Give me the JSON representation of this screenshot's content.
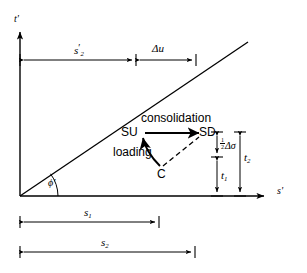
{
  "figure": {
    "type": "stress-path-diagram"
  },
  "axes": {
    "y_label": "t'",
    "x_label": "s'",
    "origin_x": 20,
    "origin_y": 196
  },
  "failure_line": {
    "label": "Kf-line",
    "angle_label": "ϕ'",
    "start": [
      20,
      196
    ],
    "end": [
      248,
      42
    ]
  },
  "points": {
    "su": "SU",
    "sd": "SD",
    "c": "C"
  },
  "paths": {
    "consolidation": "consolidation",
    "loading": "loading"
  },
  "dimensions": {
    "s2_prime": {
      "base": "s",
      "prime": "′",
      "sub": "2"
    },
    "delta_u": "Δu",
    "half_delta_sigma_num": "1",
    "half_delta_sigma_den": "2",
    "half_delta_sigma_rest": "Δσ",
    "t1": {
      "base": "t",
      "sub": "1"
    },
    "t2": {
      "base": "t",
      "sub": "2"
    },
    "s1_bar": {
      "base": "s",
      "sub": "1"
    },
    "s2_bar": {
      "base": "s",
      "sub": "2"
    }
  },
  "colors": {
    "line": "#000000",
    "background": "#ffffff"
  }
}
